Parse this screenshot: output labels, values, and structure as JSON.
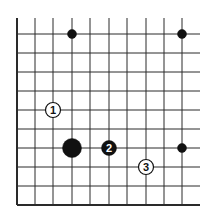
{
  "diagram": {
    "type": "go-board-fragment",
    "colors": {
      "background": "#ffffff",
      "line": "#2a2a2a",
      "black": "#111111",
      "white": "#ffffff"
    },
    "grid": {
      "x_lines": [
        17,
        35,
        53,
        72,
        90,
        109,
        127,
        146,
        164,
        182
      ],
      "y_lines": [
        34,
        53,
        72,
        91,
        110,
        129,
        148,
        167,
        186,
        205
      ],
      "top": 18,
      "right": 200,
      "left_edge_x": 17,
      "bottom_edge_y": 205
    },
    "stones": [
      {
        "id": "small-black-1",
        "color": "black",
        "x": 72,
        "y": 34,
        "size": "small",
        "label": ""
      },
      {
        "id": "small-black-2",
        "color": "black",
        "x": 182,
        "y": 34,
        "size": "small",
        "label": ""
      },
      {
        "id": "small-black-3",
        "color": "black",
        "x": 182,
        "y": 148,
        "size": "small",
        "label": ""
      },
      {
        "id": "large-black",
        "color": "black",
        "x": 72,
        "y": 148,
        "size": "large",
        "label": ""
      },
      {
        "id": "move-1",
        "color": "white",
        "x": 53,
        "y": 110,
        "size": "medium",
        "label": "1"
      },
      {
        "id": "move-2",
        "color": "black",
        "x": 109,
        "y": 148,
        "size": "medium",
        "label": "2"
      },
      {
        "id": "move-3",
        "color": "white",
        "x": 146,
        "y": 167,
        "size": "medium",
        "label": "3"
      }
    ]
  }
}
